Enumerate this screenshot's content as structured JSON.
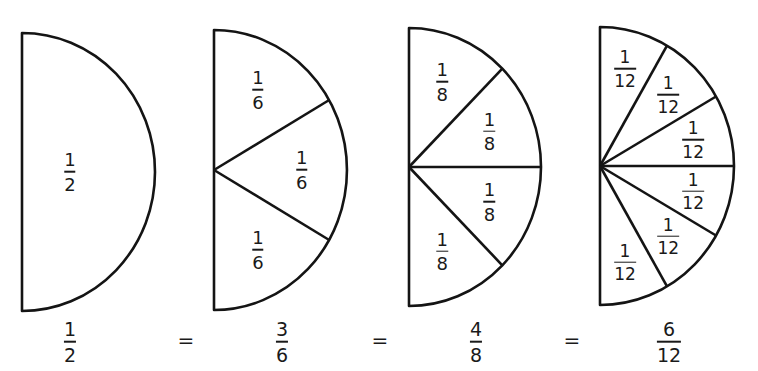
{
  "diagram": {
    "stroke_color": "#141414",
    "fill_color": "#ffffff",
    "shapes": [
      {
        "id": "halves",
        "cx": 22,
        "cy": 172,
        "rx": 133,
        "ry": 139,
        "divisions": 1,
        "slice_label": {
          "num": "1",
          "den": "2"
        },
        "caption": {
          "num": "1",
          "den": "2"
        },
        "caption_x": 70
      },
      {
        "id": "sixths",
        "cx": 214,
        "cy": 170,
        "rx": 133,
        "ry": 140,
        "divisions": 3,
        "slice_label": {
          "num": "1",
          "den": "6"
        },
        "caption": {
          "num": "3",
          "den": "6"
        },
        "caption_x": 282
      },
      {
        "id": "eighths",
        "cx": 409,
        "cy": 167,
        "rx": 132,
        "ry": 139,
        "divisions": 4,
        "slice_label": {
          "num": "1",
          "den": "8"
        },
        "caption": {
          "num": "4",
          "den": "8"
        },
        "caption_x": 476
      },
      {
        "id": "twelfths",
        "cx": 600,
        "cy": 166,
        "rx": 134,
        "ry": 139,
        "divisions": 6,
        "slice_label": {
          "num": "1",
          "den": "12"
        },
        "caption": {
          "num": "6",
          "den": "12"
        },
        "caption_x": 669
      }
    ],
    "equals_sign": "=",
    "equals_x": [
      186,
      380,
      572
    ],
    "caption_y": 342
  }
}
